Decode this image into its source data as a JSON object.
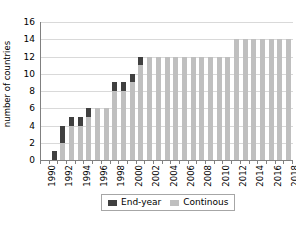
{
  "chart_data": {
    "type": "bar",
    "title": "",
    "subtitle": "",
    "xlabel": "",
    "ylabel": "number of countries",
    "stacked": true,
    "grid": "horizontal",
    "legend_position": "bottom",
    "ylim": [
      0,
      16
    ],
    "ytick_step": 2,
    "ytick_labels": [
      "0",
      "2",
      "4",
      "6",
      "8",
      "10",
      "12",
      "14",
      "16"
    ],
    "ytick_values": [
      0,
      2,
      4,
      6,
      8,
      10,
      12,
      14,
      16
    ],
    "categories": [
      "1990",
      "1991",
      "1992",
      "1993",
      "1994",
      "1995",
      "1996",
      "1997",
      "1998",
      "1999",
      "2000",
      "2001",
      "2002",
      "2003",
      "2004",
      "2005",
      "2006",
      "2007",
      "2008",
      "2009",
      "2010",
      "2011",
      "2012",
      "2013",
      "2014",
      "2015",
      "2016",
      "2017",
      "2018"
    ],
    "xtick_labels": [
      "1990",
      "1992",
      "1994",
      "1996",
      "1998",
      "2000",
      "2002",
      "2004",
      "2006",
      "2008",
      "2010",
      "2012",
      "2014",
      "2016",
      "2018"
    ],
    "series": [
      {
        "name": "Continous",
        "color": "#bfbfbf",
        "values": [
          0,
          0,
          2,
          4,
          4,
          5,
          6,
          6,
          8,
          8,
          9,
          11,
          12,
          12,
          12,
          12,
          12,
          12,
          12,
          12,
          12,
          12,
          14,
          14,
          14,
          14,
          14,
          14,
          14
        ]
      },
      {
        "name": "End-year",
        "color": "#404040",
        "values": [
          0,
          1,
          2,
          1,
          1,
          1,
          0,
          0,
          1,
          1,
          1,
          1,
          0,
          0,
          0,
          0,
          0,
          0,
          0,
          0,
          0,
          0,
          0,
          0,
          0,
          0,
          0,
          0,
          0
        ]
      }
    ],
    "totals": [
      0,
      1,
      4,
      5,
      5,
      6,
      6,
      6,
      9,
      9,
      10,
      12,
      12,
      12,
      12,
      12,
      12,
      12,
      12,
      12,
      12,
      12,
      14,
      14,
      14,
      14,
      14,
      14,
      14
    ]
  },
  "legend": {
    "entries": [
      {
        "label": "End-year",
        "swatch": "endyear-swatch"
      },
      {
        "label": "Continous",
        "swatch": "continuous-swatch"
      }
    ]
  }
}
